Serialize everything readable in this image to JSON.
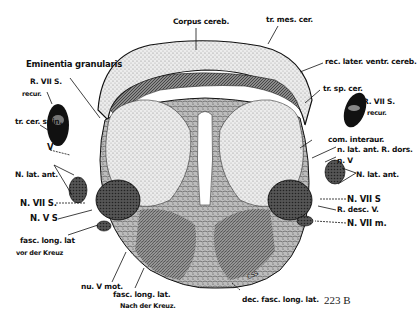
{
  "figure": {
    "number": "223 B",
    "signature": "CSS",
    "labels": {
      "corpus_cereb": "Corpus cereb.",
      "tr_mes_cer": "tr. mes. cer.",
      "eminentia_granularis": "Eminentia granularis",
      "rec_later_ventr_cereb": "rec. later. ventr. cereb.",
      "r_vii_s_recur_left_1": "R. VII S.",
      "r_vii_s_recur_left_2": "recur.",
      "tr_cer_spin": "tr. cer. spin.",
      "tr_sp_cer": "tr. sp. cer.",
      "r_vii_s_recur_right_1": "R. VII S.",
      "r_vii_s_recur_right_2": "recur.",
      "v": "V",
      "com_interaur": "com. interaur.",
      "n_lat_ant_r_dors": "n. lat. ant. R. dors.",
      "n_v": "n. V",
      "n_lat_ant_left": "N. lat. ant.",
      "n_lat_ant_right": "N. lat. ant.",
      "n_vii_s_left": "N. VII S.",
      "n_v_s": "N. V S",
      "n_vii_s_right": "N. VII S",
      "r_desc_v": "R. desc. V.",
      "n_vii_m": "N. VII m.",
      "fasc_long_lat_vor_1": "fasc. long. lat",
      "fasc_long_lat_vor_2": "vor der Kreuz",
      "nu_v_mot": "nu. V mot.",
      "fasc_long_lat_nach_1": "fasc. long. lat.",
      "fasc_long_lat_nach_2": "Nach der Kreuz.",
      "dec_fasc_long_lat": "dec. fasc. long. lat."
    }
  }
}
